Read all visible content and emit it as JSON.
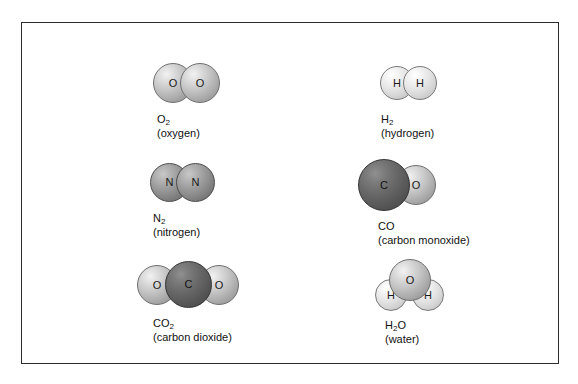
{
  "figure": {
    "kind": "molecular-space-filling-diagram",
    "border_color": "#2b2b2b",
    "background": "#ffffff"
  },
  "molecules": [
    {
      "id": "oxygen",
      "formula_main": "O",
      "formula_sub": "2",
      "common_name": "(oxygen)",
      "atoms": [
        {
          "label": "O",
          "shade": "light"
        },
        {
          "label": "O",
          "shade": "light"
        }
      ]
    },
    {
      "id": "hydrogen",
      "formula_main": "H",
      "formula_sub": "2",
      "common_name": "(hydrogen)",
      "atoms": [
        {
          "label": "H",
          "shade": "pale"
        },
        {
          "label": "H",
          "shade": "pale"
        }
      ]
    },
    {
      "id": "nitrogen",
      "formula_main": "N",
      "formula_sub": "2",
      "common_name": "(nitrogen)",
      "atoms": [
        {
          "label": "N",
          "shade": "mid"
        },
        {
          "label": "N",
          "shade": "mid"
        }
      ]
    },
    {
      "id": "carbon-monoxide",
      "formula_main": "CO",
      "formula_sub": "",
      "common_name": "(carbon monoxide)",
      "atoms": [
        {
          "label": "C",
          "shade": "dark"
        },
        {
          "label": "O",
          "shade": "light"
        }
      ]
    },
    {
      "id": "carbon-dioxide",
      "formula_main": "CO",
      "formula_sub": "2",
      "common_name": "(carbon dioxide)",
      "atoms": [
        {
          "label": "O",
          "shade": "light"
        },
        {
          "label": "C",
          "shade": "dark"
        },
        {
          "label": "O",
          "shade": "light"
        }
      ]
    },
    {
      "id": "water",
      "formula_main": "H",
      "formula_sub": "2",
      "formula_tail": "O",
      "common_name": "(water)",
      "atoms": [
        {
          "label": "O",
          "shade": "light"
        },
        {
          "label": "H",
          "shade": "pale"
        },
        {
          "label": "H",
          "shade": "pale"
        }
      ]
    }
  ]
}
